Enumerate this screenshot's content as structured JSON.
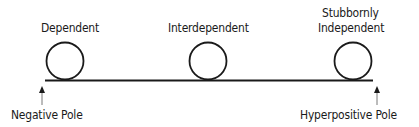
{
  "diagram": {
    "type": "spectrum",
    "axis": {
      "left_pole": "Negative Pole",
      "right_pole": "Hyperpositive Pole"
    },
    "positions": [
      {
        "label": "Dependent"
      },
      {
        "label": "Interdependent"
      },
      {
        "label_line1": "Stubbornly",
        "label_line2": "Independent"
      }
    ],
    "colors": {
      "stroke": "#1a1a1a",
      "background": "#ffffff"
    }
  }
}
